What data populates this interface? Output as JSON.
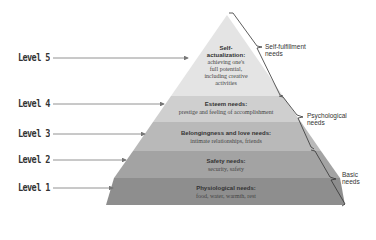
{
  "diagram": {
    "type": "pyramid",
    "colors": {
      "tier5": "#e4e4e4",
      "tier4": "#cfcfcf",
      "tier3": "#b9b9b9",
      "tier2": "#a3a3a3",
      "tier1": "#8e8e8e",
      "arrow": "#777777",
      "bracket": "#333333"
    },
    "levels": [
      {
        "label": "Level 5",
        "title": "Self-actualization:",
        "title_lines": [
          "Self-",
          "actualization:"
        ],
        "desc_lines": [
          "achieving one's",
          "full potential,",
          "including creative",
          "activities"
        ]
      },
      {
        "label": "Level 4",
        "title": "Esteem needs:",
        "desc_lines": [
          "prestige and feeling of accomplishment"
        ]
      },
      {
        "label": "Level 3",
        "title": "Belongingness and love needs:",
        "desc_lines": [
          "intimate relationships, friends"
        ]
      },
      {
        "label": "Level 2",
        "title": "Safety needs:",
        "desc_lines": [
          "security, safety"
        ]
      },
      {
        "label": "Level 1",
        "title": "Physiological needs:",
        "desc_lines": [
          "food, water, warmth, rest"
        ]
      }
    ],
    "groups": [
      {
        "lines": [
          "Self-fulfillment",
          "needs"
        ]
      },
      {
        "lines": [
          "Psychological",
          "needs"
        ]
      },
      {
        "lines": [
          "Basic",
          "needs"
        ]
      }
    ]
  }
}
